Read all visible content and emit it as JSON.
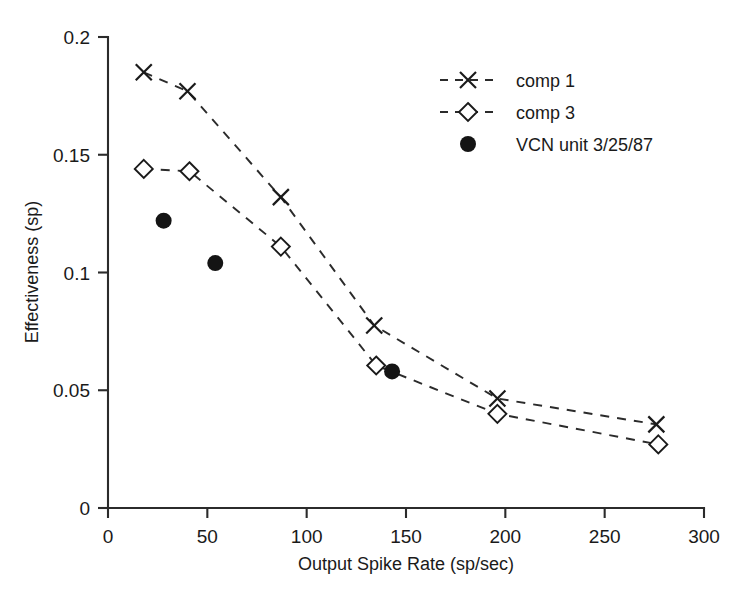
{
  "chart_data": {
    "type": "scatter",
    "title": "",
    "xlabel": "Output Spike Rate (sp/sec)",
    "ylabel": "Effectiveness (sp)",
    "xlim": [
      0,
      300
    ],
    "ylim": [
      0,
      0.2
    ],
    "xticks": [
      0,
      50,
      100,
      150,
      200,
      250,
      300
    ],
    "xtick_labels": [
      "0",
      "50",
      "100",
      "150",
      "200",
      "250",
      "300"
    ],
    "yticks": [
      0,
      0.05,
      0.1,
      0.15,
      0.2
    ],
    "ytick_labels": [
      "0",
      "0.05",
      "0.1",
      "0.15",
      "0.2"
    ],
    "grid": false,
    "legend_position": "upper right",
    "series": [
      {
        "name": "comp 1",
        "marker": "x",
        "linestyle": "dashed",
        "x": [
          18,
          40,
          87,
          134,
          196,
          276
        ],
        "y": [
          0.185,
          0.177,
          0.132,
          0.0775,
          0.0465,
          0.0355
        ]
      },
      {
        "name": "comp 3",
        "marker": "diamond",
        "linestyle": "dashed",
        "x": [
          18,
          41,
          87,
          135,
          196,
          277
        ],
        "y": [
          0.144,
          0.143,
          0.111,
          0.0605,
          0.04,
          0.027
        ]
      },
      {
        "name": "VCN unit 3/25/87",
        "marker": "filled-circle",
        "linestyle": "none",
        "x": [
          28,
          54,
          143
        ],
        "y": [
          0.122,
          0.104,
          0.058
        ]
      }
    ]
  },
  "axes": {
    "x_title": "Output Spike Rate (sp/sec)",
    "y_title": "Effectiveness (sp)",
    "x_tick_labels": [
      "0",
      "50",
      "100",
      "150",
      "200",
      "250",
      "300"
    ],
    "y_tick_labels": [
      "0",
      "0.05",
      "0.1",
      "0.15",
      "0.2"
    ]
  },
  "legend": {
    "items": [
      {
        "label": "comp 1",
        "marker": "x-marker",
        "has_line": true
      },
      {
        "label": "comp 3",
        "marker": "diamond-marker",
        "has_line": true
      },
      {
        "label": "VCN unit 3/25/87",
        "marker": "filled-circle-marker",
        "has_line": false
      }
    ]
  },
  "colors": {
    "foreground": "#1a1a1a",
    "axis": "#2b2b2b",
    "background": "#ffffff"
  }
}
